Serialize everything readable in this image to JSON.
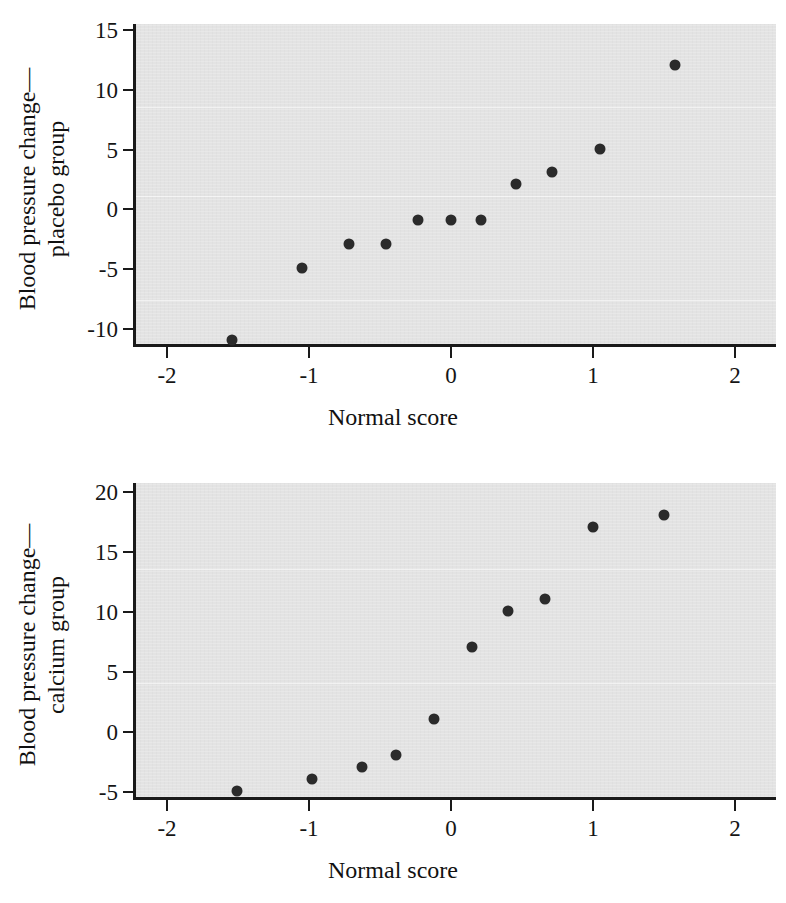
{
  "page": {
    "background_color": "#ffffff",
    "panel_color": "#e3e3e3",
    "marker_color": "#2b2b2b",
    "axis_color": "#1a1a1a"
  },
  "figures": [
    {
      "id": "placebo-normal-probability-plot",
      "ylabel_line1": "Blood pressure change—",
      "ylabel_line2": "placebo group",
      "xlabel": "Normal score",
      "xticks": [
        "-2",
        "-1",
        "0",
        "1",
        "2"
      ],
      "yticks": [
        "15",
        "10",
        "5",
        "0",
        "-5",
        "-10"
      ]
    },
    {
      "id": "calcium-normal-probability-plot",
      "ylabel_line1": "Blood pressure change—",
      "ylabel_line2": "calcium group",
      "xlabel": "Normal score",
      "xticks": [
        "-2",
        "-1",
        "0",
        "1",
        "2"
      ],
      "yticks": [
        "20",
        "15",
        "10",
        "5",
        "0",
        "-5"
      ]
    }
  ],
  "chart_data": [
    {
      "type": "scatter",
      "title": "",
      "xlabel": "Normal score",
      "ylabel": "Blood pressure change—placebo group",
      "xlim": [
        -2.25,
        2.25
      ],
      "ylim": [
        -12.5,
        15.6
      ],
      "xticks": [
        -2,
        -1,
        0,
        1,
        2
      ],
      "yticks": [
        -10,
        -5,
        0,
        5,
        10,
        15
      ],
      "grid": false,
      "legend": "none",
      "points": [
        {
          "x": -1.54,
          "y": -11
        },
        {
          "x": -1.05,
          "y": -5
        },
        {
          "x": -0.72,
          "y": -3
        },
        {
          "x": -0.46,
          "y": -3
        },
        {
          "x": -0.23,
          "y": -1
        },
        {
          "x": 0.0,
          "y": -1
        },
        {
          "x": 0.21,
          "y": -1
        },
        {
          "x": 0.46,
          "y": 2
        },
        {
          "x": 0.71,
          "y": 3
        },
        {
          "x": 1.05,
          "y": 5
        },
        {
          "x": 1.58,
          "y": 12
        }
      ]
    },
    {
      "type": "scatter",
      "title": "",
      "xlabel": "Normal score",
      "ylabel": "Blood pressure change—calcium group",
      "xlim": [
        -2.25,
        2.25
      ],
      "ylim": [
        -6.2,
        21.0
      ],
      "xticks": [
        -2,
        -1,
        0,
        1,
        2
      ],
      "yticks": [
        -5,
        0,
        5,
        10,
        15,
        20
      ],
      "grid": false,
      "legend": "none",
      "points": [
        {
          "x": -1.51,
          "y": -5
        },
        {
          "x": -0.98,
          "y": -4
        },
        {
          "x": -0.63,
          "y": -3
        },
        {
          "x": -0.39,
          "y": -2
        },
        {
          "x": -0.12,
          "y": 1
        },
        {
          "x": 0.15,
          "y": 7
        },
        {
          "x": 0.4,
          "y": 10
        },
        {
          "x": 0.66,
          "y": 11
        },
        {
          "x": 1.0,
          "y": 17
        },
        {
          "x": 1.5,
          "y": 18
        }
      ]
    }
  ],
  "artifacts": {
    "smudge_top": "",
    "smudge_bottom": ""
  }
}
